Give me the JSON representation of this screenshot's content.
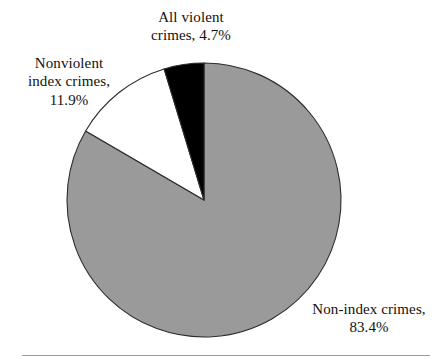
{
  "chart_data": {
    "type": "pie",
    "title": "",
    "subtitle": "",
    "xlabel": "",
    "ylabel": "",
    "legend_position": "none",
    "grid": false,
    "units": "percent",
    "start_angle_deg": 90,
    "direction": "counterclockwise",
    "center": {
      "x": 204,
      "y": 200
    },
    "radius": 137,
    "categories": [
      "All violent crimes",
      "Nonviolent index crimes",
      "Non-index crimes"
    ],
    "values": [
      4.7,
      11.9,
      83.4
    ],
    "slices": [
      {
        "name": "All violent crimes",
        "value": 4.7,
        "value_label": "4.7%",
        "color": "#000000",
        "outline": "#2b2b2b",
        "label_lines": [
          "All violent",
          "crimes, 4.7%"
        ],
        "label_text": "All violent\ncrimes, 4.7%"
      },
      {
        "name": "Nonviolent index crimes",
        "value": 11.9,
        "value_label": "11.9%",
        "color": "#ffffff",
        "outline": "#2b2b2b",
        "label_lines": [
          "Nonviolent",
          "index crimes,",
          "11.9%"
        ],
        "label_text": "Nonviolent\nindex crimes,\n11.9%"
      },
      {
        "name": "Non-index crimes",
        "value": 83.4,
        "value_label": "83.4%",
        "color": "#9a9a9a",
        "outline": "#2b2b2b",
        "label_lines": [
          "Non-index crimes,",
          "83.4%"
        ],
        "label_text": "Non-index crimes,\n83.4%"
      }
    ],
    "colors": {
      "violent": "#000000",
      "nonviolent": "#ffffff",
      "nonindex": "#9a9a9a",
      "outline": "#2b2b2b",
      "rule": "#9d9d9d",
      "background": "#ffffff",
      "text": "#111111"
    }
  },
  "figure": {
    "rule_present": true
  }
}
